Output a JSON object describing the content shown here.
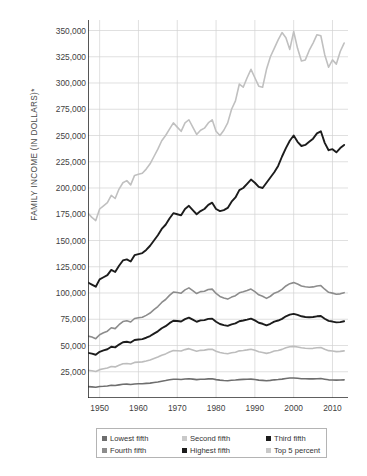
{
  "chart_data": {
    "type": "line",
    "title": "",
    "xlabel": "",
    "ylabel": "FAMILY INCOME (IN DOLLARS)*",
    "xlim": [
      1947,
      2014
    ],
    "ylim": [
      0,
      360000
    ],
    "grid": true,
    "legend_position": "bottom",
    "x_ticks": [
      "1950",
      "1960",
      "1970",
      "1980",
      "1990",
      "2000",
      "2010"
    ],
    "x_tick_values": [
      1950,
      1960,
      1970,
      1980,
      1990,
      2000,
      2010
    ],
    "y_ticks": [
      "25,000",
      "50,000",
      "75,000",
      "100,000",
      "125,000",
      "150,000",
      "175,000",
      "200,000",
      "225,000",
      "250,000",
      "275,000",
      "300,000",
      "325,000",
      "350,000"
    ],
    "y_tick_values": [
      25000,
      50000,
      75000,
      100000,
      125000,
      150000,
      175000,
      200000,
      225000,
      250000,
      275000,
      300000,
      325000,
      350000
    ],
    "x": [
      1947,
      1948,
      1949,
      1950,
      1951,
      1952,
      1953,
      1954,
      1955,
      1956,
      1957,
      1958,
      1959,
      1960,
      1961,
      1962,
      1963,
      1964,
      1965,
      1966,
      1967,
      1968,
      1969,
      1970,
      1971,
      1972,
      1973,
      1974,
      1975,
      1976,
      1977,
      1978,
      1979,
      1980,
      1981,
      1982,
      1983,
      1984,
      1985,
      1986,
      1987,
      1988,
      1989,
      1990,
      1991,
      1992,
      1993,
      1994,
      1995,
      1996,
      1997,
      1998,
      1999,
      2000,
      2001,
      2002,
      2003,
      2004,
      2005,
      2006,
      2007,
      2008,
      2009,
      2010,
      2011,
      2012,
      2013
    ],
    "series": [
      {
        "name": "Lowest fifth",
        "color": "#6e6e6e",
        "values": [
          10800,
          10600,
          10300,
          11000,
          11200,
          11500,
          12100,
          11900,
          12500,
          13100,
          13200,
          12900,
          13400,
          13500,
          13600,
          13900,
          14200,
          14800,
          15300,
          16000,
          16600,
          17300,
          17900,
          17800,
          17600,
          18100,
          18400,
          18000,
          17500,
          17800,
          17900,
          18200,
          18300,
          17500,
          17000,
          16600,
          16500,
          16900,
          17100,
          17500,
          17700,
          17800,
          18000,
          17600,
          17000,
          16800,
          16400,
          16800,
          17300,
          17600,
          18000,
          18600,
          19000,
          19100,
          18800,
          18400,
          18300,
          18200,
          18200,
          18400,
          18500,
          17900,
          17300,
          17200,
          17000,
          17100,
          17300
        ]
      },
      {
        "name": "Second fifth",
        "color": "#bdbdbd",
        "values": [
          26500,
          26000,
          25300,
          27000,
          27800,
          28500,
          30000,
          29600,
          31200,
          32600,
          32900,
          32400,
          33900,
          34200,
          34400,
          35200,
          36200,
          37600,
          39000,
          40800,
          42000,
          43800,
          45200,
          45000,
          44700,
          46100,
          47000,
          45800,
          44600,
          45400,
          45600,
          46300,
          46400,
          44600,
          43300,
          42600,
          42200,
          43100,
          43600,
          44900,
          45300,
          45800,
          46400,
          45400,
          44000,
          43400,
          42500,
          43400,
          44700,
          45300,
          46300,
          47800,
          48800,
          49200,
          48600,
          47800,
          47400,
          47200,
          47300,
          47800,
          48000,
          46400,
          45100,
          44700,
          44200,
          44400,
          44900
        ]
      },
      {
        "name": "Third fifth",
        "color": "#1c1c1c",
        "values": [
          43000,
          42300,
          41200,
          44000,
          45300,
          46400,
          48800,
          48200,
          50900,
          53100,
          53600,
          52800,
          55200,
          55700,
          56100,
          57400,
          59000,
          61300,
          63500,
          66400,
          68400,
          71300,
          73600,
          73300,
          72800,
          75100,
          76500,
          74600,
          72600,
          73900,
          74200,
          75400,
          75600,
          72600,
          70500,
          69400,
          68700,
          70100,
          71000,
          73100,
          73800,
          74600,
          75600,
          73900,
          71700,
          70700,
          69200,
          70700,
          72800,
          73800,
          75400,
          77800,
          79400,
          80100,
          79100,
          77800,
          77200,
          76900,
          77100,
          77800,
          78100,
          75500,
          73400,
          72800,
          72000,
          72300,
          73100
        ]
      },
      {
        "name": "Fourth fifth",
        "color": "#8c8c8c",
        "values": [
          59000,
          58000,
          56500,
          60300,
          62100,
          63600,
          66900,
          66100,
          69800,
          72800,
          73500,
          72400,
          75700,
          76400,
          76900,
          78700,
          80900,
          84100,
          87100,
          91000,
          93800,
          97700,
          100900,
          100500,
          99800,
          103000,
          104900,
          102300,
          99500,
          101300,
          101700,
          103400,
          103700,
          99600,
          96700,
          95200,
          94200,
          96100,
          97400,
          100200,
          101200,
          102300,
          103700,
          101300,
          98300,
          96900,
          94900,
          96900,
          99800,
          101200,
          103400,
          106700,
          108900,
          109900,
          108500,
          106700,
          105900,
          105500,
          105800,
          106700,
          107100,
          103600,
          100700,
          99900,
          98800,
          99200,
          100300
        ]
      },
      {
        "name": "Highest fifth",
        "color": "#1c1c1c",
        "values": [
          110000,
          108000,
          106000,
          113000,
          115000,
          117000,
          122000,
          120000,
          126000,
          131000,
          132000,
          130000,
          136000,
          137000,
          138000,
          141000,
          145000,
          150000,
          155000,
          161000,
          165000,
          171000,
          176000,
          175000,
          174000,
          180000,
          183000,
          179000,
          175000,
          178000,
          180000,
          184000,
          186000,
          180000,
          178000,
          179000,
          181000,
          187000,
          191000,
          198000,
          200000,
          204000,
          208000,
          205000,
          201000,
          200000,
          205000,
          210000,
          215000,
          221000,
          230000,
          238000,
          245000,
          250000,
          244000,
          240000,
          241000,
          244000,
          247000,
          252000,
          254000,
          243000,
          236000,
          237000,
          234000,
          238000,
          241000
        ]
      },
      {
        "name": "Top 5 percent",
        "color": "#c0c0c0",
        "values": [
          176000,
          172000,
          169000,
          180000,
          183000,
          186000,
          193000,
          190000,
          199000,
          205000,
          207000,
          203000,
          212000,
          213000,
          214000,
          218000,
          223000,
          230000,
          237000,
          245000,
          250000,
          256000,
          262000,
          258000,
          254000,
          262000,
          265000,
          258000,
          251000,
          255000,
          257000,
          262000,
          265000,
          254000,
          250000,
          255000,
          262000,
          275000,
          283000,
          299000,
          296000,
          305000,
          313000,
          305000,
          297000,
          296000,
          313000,
          325000,
          333000,
          341000,
          348000,
          343000,
          332000,
          349000,
          333000,
          321000,
          322000,
          331000,
          338000,
          346000,
          345000,
          327000,
          315000,
          322000,
          318000,
          330000,
          338000
        ]
      }
    ]
  },
  "legend": {
    "items": [
      {
        "label": "Lowest fifth",
        "color": "#6e6e6e"
      },
      {
        "label": "Second fifth",
        "color": "#c9c9c9"
      },
      {
        "label": "Third fifth",
        "color": "#1c1c1c"
      },
      {
        "label": "Fourth fifth",
        "color": "#8c8c8c"
      },
      {
        "label": "Highest fifth",
        "color": "#1c1c1c"
      },
      {
        "label": "Top 5 percent",
        "color": "#c9c9c9"
      }
    ]
  },
  "colors": {
    "grid": "#d2d2d2",
    "axis": "#2b2b2b",
    "background": "#ffffff",
    "text": "#3f3f3f"
  }
}
